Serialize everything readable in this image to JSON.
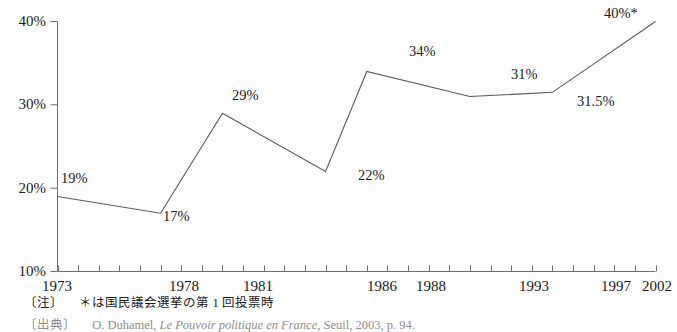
{
  "chart_data": {
    "type": "line",
    "title": "",
    "subtitle": "",
    "xlabel": "",
    "ylabel": "",
    "x": [
      1973,
      1978,
      1981,
      1986,
      1988,
      1993,
      1997,
      2002
    ],
    "values": [
      19,
      17,
      29,
      22,
      34,
      31,
      31.5,
      40
    ],
    "point_labels": [
      "19%",
      "17%",
      "29%",
      "22%",
      "34%",
      "31%",
      "31.5%",
      "40%*"
    ],
    "categories": [
      "1973",
      "1978",
      "1981",
      "1986",
      "1988",
      "1993",
      "1997",
      "2002"
    ],
    "x_tick_labels": [
      "1973",
      "1978",
      "1981",
      "1986",
      "1988",
      "1993",
      "1997",
      "2002"
    ],
    "y_tick_labels": [
      "10%",
      "20%",
      "30%",
      "40%"
    ],
    "y_ticks": [
      10,
      20,
      30,
      40
    ],
    "ylim": [
      10,
      40
    ],
    "xlim": [
      1973,
      2002
    ],
    "x_minor_tick_interval": 1,
    "grid": false,
    "legend": false,
    "legend_position": "none",
    "line_color": "#595959",
    "axis_color": "#6e6e6e",
    "background_color": "#ffffff",
    "series": [
      {
        "name": "",
        "values": [
          19,
          17,
          29,
          22,
          34,
          31,
          31.5,
          40
        ]
      }
    ],
    "annotations": [
      {
        "label": "40%*",
        "note": "asterisk marks first round of National Assembly election"
      }
    ]
  },
  "footnotes": {
    "note_bracket": "〔注〕",
    "note_text": "＊は国民議会選挙の第 1 回投票時",
    "source_bracket": "〔出典〕",
    "source_text_plain_1": "O. Duhamel, ",
    "source_text_italic": "Le Pouvoir politique en France",
    "source_text_plain_2": ", Seuil, 2003, p. 94."
  }
}
